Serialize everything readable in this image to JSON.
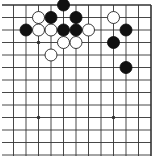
{
  "board": {
    "description": "Go board fragment (top-right corner region)",
    "visible_columns": 12,
    "visible_rows": 13,
    "edges_shown": [
      "top",
      "right"
    ],
    "colors": {
      "background": "#ffffff",
      "line": "#333333",
      "black_stone": "#111111",
      "white_stone": "#ffffff",
      "white_stone_outline": "#222222"
    },
    "star_points": [
      {
        "col": 2,
        "row": 3
      },
      {
        "col": 2,
        "row": 9
      },
      {
        "col": 8,
        "row": 9
      }
    ],
    "stones": [
      {
        "color": "black",
        "col": 4,
        "row": 0
      },
      {
        "color": "white",
        "col": 2,
        "row": 1
      },
      {
        "color": "black",
        "col": 3,
        "row": 1
      },
      {
        "color": "black",
        "col": 5,
        "row": 1
      },
      {
        "color": "white",
        "col": 8,
        "row": 1
      },
      {
        "color": "black",
        "col": 1,
        "row": 2
      },
      {
        "color": "white",
        "col": 2,
        "row": 2
      },
      {
        "color": "white",
        "col": 3,
        "row": 2
      },
      {
        "color": "black",
        "col": 4,
        "row": 2
      },
      {
        "color": "black",
        "col": 5,
        "row": 2
      },
      {
        "color": "white",
        "col": 6,
        "row": 2
      },
      {
        "color": "black",
        "col": 9,
        "row": 2
      },
      {
        "color": "white",
        "col": 4,
        "row": 3
      },
      {
        "color": "white",
        "col": 5,
        "row": 3
      },
      {
        "color": "black",
        "col": 8,
        "row": 3
      },
      {
        "color": "white",
        "col": 3,
        "row": 4
      },
      {
        "color": "black",
        "col": 9,
        "row": 5
      }
    ]
  }
}
